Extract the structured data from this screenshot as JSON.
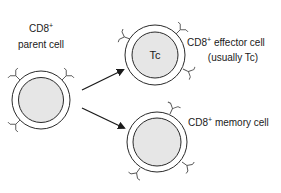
{
  "diagram": {
    "colors": {
      "stroke": "#2a2a2a",
      "cell_fill": "#e6e6e6",
      "background": "#ffffff"
    },
    "parent": {
      "label_line1": "CD8",
      "label_line1_sup": "+",
      "label_line2": "parent cell"
    },
    "effector": {
      "label_line1": "CD8",
      "label_line1_sup": "+",
      "label_line1_rest": " effector cell",
      "label_line2": "(usually Tc)",
      "inner_label": "Tc"
    },
    "memory": {
      "label": "CD8",
      "label_sup": "+",
      "label_rest": " memory cell"
    },
    "arrows": [
      {
        "from": "parent",
        "to": "effector"
      },
      {
        "from": "parent",
        "to": "memory"
      }
    ]
  }
}
